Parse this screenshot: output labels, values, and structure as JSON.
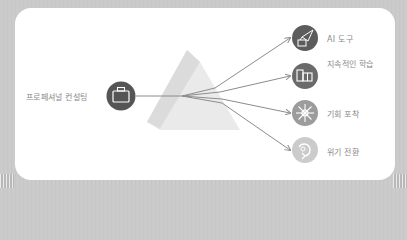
{
  "source": {
    "label": "프로페셔널 컨설팅",
    "icon": "briefcase-icon",
    "color": "#555555"
  },
  "prism": {
    "fill": "#e6e6e6",
    "fill_back": "#dcdcdc"
  },
  "outputs": [
    {
      "label": "AI 도구",
      "icon": "rocket-robot-icon",
      "color": "#5c5c5c"
    },
    {
      "label": "지속적인 학습",
      "icon": "books-icon",
      "color": "#6a6a6a"
    },
    {
      "label": "기회 포착",
      "icon": "snowflake-flower-icon",
      "color": "#9c9c9c"
    },
    {
      "label": "위기 전환",
      "icon": "cycle-arrow-icon",
      "color": "#cbcbcb"
    }
  ],
  "colors": {
    "background": "#c8c8c8",
    "card": "#ffffff",
    "line": "#8c8c8c",
    "text": "#8a8a8a"
  }
}
